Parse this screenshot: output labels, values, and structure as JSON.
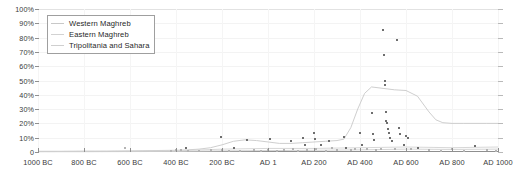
{
  "chart_data": {
    "type": "line",
    "title": "",
    "xlabel": "",
    "ylabel": "",
    "xlim": [
      -1000,
      1000
    ],
    "ylim": [
      0,
      100
    ],
    "grid": true,
    "legend_position": "top-left",
    "x_tick_labels": [
      "1000 BC",
      "800 BC",
      "600 BC",
      "400 BC",
      "200 BC",
      "AD 1",
      "AD 200",
      "AD 400",
      "AD 600",
      "AD 800",
      "AD 1000"
    ],
    "x_tick_values": [
      -1000,
      -800,
      -600,
      -400,
      -200,
      1,
      200,
      400,
      600,
      800,
      1000
    ],
    "y_tick_labels": [
      "0",
      "10%",
      "20%",
      "30%",
      "40%",
      "50%",
      "60%",
      "70%",
      "80%",
      "90%",
      "100%"
    ],
    "y_tick_values": [
      0,
      10,
      20,
      30,
      40,
      50,
      60,
      70,
      80,
      90,
      100
    ],
    "legend": [
      "Western Maghreb",
      "Eastern Maghreb",
      "Tripolitania and Sahara"
    ],
    "colors": {
      "western_maghreb": "#c8c8c8",
      "eastern_maghreb": "#d2d2d2",
      "tripolitania_and_sahara": "#cfcfcf",
      "axis": "#8f8f8f",
      "grid": "#f3f3f3",
      "point": "#6e6e6e",
      "text": "#3a3a3a"
    },
    "series": [
      {
        "name": "Western Maghreb",
        "x": [
          -1000,
          -900,
          -800,
          -700,
          -600,
          -500,
          -400,
          -350,
          -300,
          -250,
          -200,
          -150,
          -100,
          -50,
          1,
          50,
          100,
          150,
          200,
          250,
          300,
          330,
          360,
          390,
          420,
          450,
          500,
          550,
          600,
          650,
          700,
          730,
          760,
          800,
          850,
          900,
          950,
          1000
        ],
        "values": [
          0.5,
          0.5,
          0.6,
          0.6,
          0.8,
          1.0,
          1.2,
          1.5,
          2.0,
          3.0,
          5.0,
          7.5,
          8.5,
          8.0,
          7.0,
          6.0,
          6.0,
          6.5,
          7.0,
          7.5,
          8.0,
          9.0,
          17.0,
          30.0,
          41.0,
          45.5,
          44.5,
          43.5,
          43.0,
          39.0,
          28.0,
          22.5,
          20.5,
          20.0,
          20.0,
          20.0,
          20.0,
          20.0
        ]
      },
      {
        "name": "Eastern Maghreb",
        "x": [
          -1000,
          -800,
          -600,
          -400,
          -200,
          1,
          200,
          400,
          600,
          800,
          1000
        ],
        "values": [
          0.3,
          0.4,
          0.5,
          0.8,
          2.0,
          2.5,
          2.5,
          3.0,
          3.5,
          3.0,
          3.5
        ]
      },
      {
        "name": "Tripolitania and Sahara",
        "x": [
          -1000,
          -800,
          -600,
          -400,
          -200,
          1,
          200,
          400,
          600,
          800,
          1000
        ],
        "values": [
          0.2,
          0.2,
          0.3,
          0.4,
          0.8,
          1.0,
          1.2,
          1.5,
          2.0,
          1.8,
          2.0
        ]
      }
    ],
    "scatter_points": [
      {
        "x": -620,
        "y": 2.5
      },
      {
        "x": -420,
        "y": 1.0
      },
      {
        "x": -400,
        "y": 1.5
      },
      {
        "x": -380,
        "y": 1.2
      },
      {
        "x": -355,
        "y": 3.0
      },
      {
        "x": -350,
        "y": 1.0
      },
      {
        "x": -300,
        "y": 1.0
      },
      {
        "x": -250,
        "y": 1.2
      },
      {
        "x": -205,
        "y": 10.5
      },
      {
        "x": -200,
        "y": 1.5
      },
      {
        "x": -170,
        "y": 1.0
      },
      {
        "x": -150,
        "y": 3.0
      },
      {
        "x": -120,
        "y": 1.0
      },
      {
        "x": -90,
        "y": 8.5
      },
      {
        "x": -60,
        "y": 1.5
      },
      {
        "x": -30,
        "y": 1.0
      },
      {
        "x": 1,
        "y": 1.5
      },
      {
        "x": 10,
        "y": 9.0
      },
      {
        "x": 40,
        "y": 1.0
      },
      {
        "x": 70,
        "y": 1.2
      },
      {
        "x": 100,
        "y": 8.0
      },
      {
        "x": 110,
        "y": 2.0
      },
      {
        "x": 130,
        "y": 1.0
      },
      {
        "x": 150,
        "y": 10.0
      },
      {
        "x": 160,
        "y": 5.0
      },
      {
        "x": 170,
        "y": 1.5
      },
      {
        "x": 200,
        "y": 13.5
      },
      {
        "x": 205,
        "y": 9.0
      },
      {
        "x": 210,
        "y": 2.0
      },
      {
        "x": 230,
        "y": 5.0
      },
      {
        "x": 250,
        "y": 1.0
      },
      {
        "x": 265,
        "y": 8.0
      },
      {
        "x": 280,
        "y": 2.5
      },
      {
        "x": 300,
        "y": 1.5
      },
      {
        "x": 330,
        "y": 10.5
      },
      {
        "x": 340,
        "y": 3.0
      },
      {
        "x": 360,
        "y": 1.5
      },
      {
        "x": 380,
        "y": 2.0
      },
      {
        "x": 400,
        "y": 13.0
      },
      {
        "x": 410,
        "y": 5.0
      },
      {
        "x": 430,
        "y": 2.0
      },
      {
        "x": 450,
        "y": 27.0
      },
      {
        "x": 455,
        "y": 12.5
      },
      {
        "x": 460,
        "y": 8.5
      },
      {
        "x": 470,
        "y": 1.5
      },
      {
        "x": 490,
        "y": 2.0
      },
      {
        "x": 500,
        "y": 85.0
      },
      {
        "x": 505,
        "y": 68.0
      },
      {
        "x": 508,
        "y": 50.0
      },
      {
        "x": 510,
        "y": 47.0
      },
      {
        "x": 512,
        "y": 28.0
      },
      {
        "x": 515,
        "y": 22.0
      },
      {
        "x": 518,
        "y": 20.5
      },
      {
        "x": 520,
        "y": 16.0
      },
      {
        "x": 525,
        "y": 13.0
      },
      {
        "x": 530,
        "y": 10.0
      },
      {
        "x": 540,
        "y": 7.5
      },
      {
        "x": 550,
        "y": 2.0
      },
      {
        "x": 560,
        "y": 78.0
      },
      {
        "x": 570,
        "y": 17.0
      },
      {
        "x": 575,
        "y": 12.5
      },
      {
        "x": 590,
        "y": 5.0
      },
      {
        "x": 600,
        "y": 11.0
      },
      {
        "x": 610,
        "y": 9.5
      },
      {
        "x": 620,
        "y": 2.0
      },
      {
        "x": 650,
        "y": 3.0
      },
      {
        "x": 700,
        "y": 1.5
      },
      {
        "x": 750,
        "y": 1.0
      },
      {
        "x": 800,
        "y": 2.0
      },
      {
        "x": 850,
        "y": 1.0
      },
      {
        "x": 900,
        "y": 4.5
      },
      {
        "x": 950,
        "y": 1.5
      },
      {
        "x": 990,
        "y": 1.0
      }
    ]
  }
}
